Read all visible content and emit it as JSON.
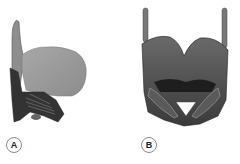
{
  "figure": {
    "panels": [
      {
        "id": "A",
        "label": "A",
        "view": "lateral larynx illustration"
      },
      {
        "id": "B",
        "label": "B",
        "view": "posterior larynx illustration"
      }
    ],
    "colors": {
      "cartilage_light": "#9a9a9a",
      "cartilage_dark": "#3a3a3a",
      "muscle": "#555555",
      "background": "#ffffff"
    }
  }
}
